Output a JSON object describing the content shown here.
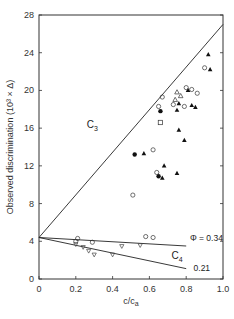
{
  "chart_data": {
    "type": "scatter",
    "title": "",
    "xlabel": "c/ca",
    "ylabel": "Observed discrimination (10³ × Δ)",
    "xlim": [
      0,
      1.0
    ],
    "ylim": [
      0,
      28
    ],
    "xticks": [
      0,
      0.2,
      0.4,
      0.6,
      0.8,
      1.0
    ],
    "xtick_labels": [
      "0",
      "0.2",
      "0.4",
      "0.6",
      "0.8",
      "1.0"
    ],
    "yticks": [
      0,
      4,
      8,
      12,
      16,
      20,
      24,
      28
    ],
    "ytick_labels": [
      "0",
      "4",
      "8",
      "12",
      "16",
      "20",
      "24",
      "28"
    ],
    "grid": false,
    "lines": [
      {
        "name": "C3",
        "x": [
          0,
          1.0
        ],
        "y": [
          4.4,
          27.0
        ]
      },
      {
        "name": "C4 Φ = 0.34",
        "x": [
          0,
          0.8
        ],
        "y": [
          4.4,
          3.5
        ]
      },
      {
        "name": "C4 Φ = 0.21",
        "x": [
          0,
          0.8
        ],
        "y": [
          4.4,
          1.1
        ]
      }
    ],
    "annotations": [
      {
        "text": "C3",
        "x": 0.26,
        "y": 16.0
      },
      {
        "text": "C4",
        "x": 0.72,
        "y": 2.1
      },
      {
        "text": "Φ = 0.34",
        "x": 0.82,
        "y": 4.0
      },
      {
        "text": "0.21",
        "x": 0.84,
        "y": 0.8
      }
    ],
    "series": [
      {
        "name": "filled triangles",
        "marker": "triangle-filled",
        "points": [
          [
            0.92,
            23.8
          ],
          [
            0.93,
            22.2
          ],
          [
            0.81,
            20.0
          ],
          [
            0.57,
            13.3
          ],
          [
            0.68,
            12.0
          ],
          [
            0.67,
            10.7
          ],
          [
            0.76,
            15.8
          ],
          [
            0.79,
            14.7
          ],
          [
            0.75,
            11.2
          ],
          [
            0.83,
            18.4
          ],
          [
            0.85,
            18.2
          ],
          [
            0.75,
            17.9
          ],
          [
            0.76,
            18.6
          ]
        ]
      },
      {
        "name": "filled circles",
        "marker": "circle-filled",
        "points": [
          [
            0.52,
            13.2
          ],
          [
            0.65,
            10.9
          ],
          [
            0.66,
            17.8
          ]
        ]
      },
      {
        "name": "open circles",
        "marker": "circle-open",
        "points": [
          [
            0.9,
            22.4
          ],
          [
            0.65,
            18.3
          ],
          [
            0.67,
            19.3
          ],
          [
            0.8,
            20.3
          ],
          [
            0.83,
            20.1
          ],
          [
            0.86,
            19.7
          ],
          [
            0.73,
            18.5
          ],
          [
            0.79,
            18.3
          ],
          [
            0.64,
            11.3
          ],
          [
            0.51,
            8.9
          ],
          [
            0.62,
            13.7
          ]
        ]
      },
      {
        "name": "open triangles",
        "marker": "triangle-open",
        "points": [
          [
            0.75,
            19.8
          ],
          [
            0.77,
            19.4
          ],
          [
            0.74,
            19.0
          ]
        ]
      },
      {
        "name": "open squares",
        "marker": "square-open",
        "points": [
          [
            0.66,
            16.6
          ]
        ]
      },
      {
        "name": "C4 open circles/diamonds (Φ=0.34)",
        "marker": "circle-open",
        "points": [
          [
            0.2,
            4.0
          ],
          [
            0.21,
            4.3
          ],
          [
            0.29,
            3.9
          ],
          [
            0.58,
            4.5
          ],
          [
            0.62,
            4.4
          ]
        ]
      },
      {
        "name": "C4 open inverted triangles (Φ=0.21)",
        "marker": "triangle-down-open",
        "points": [
          [
            0.2,
            3.7
          ],
          [
            0.24,
            3.4
          ],
          [
            0.27,
            3.0
          ],
          [
            0.3,
            2.6
          ],
          [
            0.45,
            3.5
          ],
          [
            0.4,
            2.6
          ],
          [
            0.55,
            3.6
          ]
        ]
      }
    ],
    "legend": null
  }
}
